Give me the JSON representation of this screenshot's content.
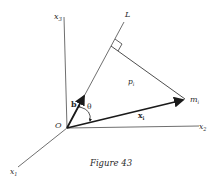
{
  "figure": {
    "caption": "Figure 43",
    "labels": {
      "x1_axis": "x",
      "x1_sub": "1",
      "x2_axis": "x",
      "x2_sub": "2",
      "x3_axis": "x",
      "x3_sub": "3",
      "line_L": "L",
      "origin": "O",
      "unit_vector_b": "b",
      "angle_theta": "θ",
      "distance_p": "p",
      "distance_p_sub": "i",
      "point_m": "m",
      "point_m_sub": "i",
      "vector_x": "x",
      "vector_x_sub": "i"
    },
    "colors": {
      "line": "#3a3a3a",
      "text": "#2a2a2a",
      "background": "#ffffff"
    }
  }
}
